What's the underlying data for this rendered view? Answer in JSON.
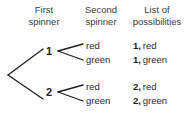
{
  "figure": {
    "type": "probability-tree-diagram",
    "background": "#ffffff",
    "line_color": "#1e1e1e",
    "text_color": "#2b2b2b"
  },
  "headers": {
    "first_spinner": {
      "line1": "First",
      "line2": "spinner"
    },
    "second_spinner": {
      "line1": "Second",
      "line2": "spinner"
    },
    "list_of_possibilities": {
      "line1": "List of",
      "line2": "possibilities"
    }
  },
  "tree": {
    "root": {
      "x": 8,
      "y": 75
    },
    "level1": [
      {
        "label": "1",
        "x": 50,
        "y": 51
      },
      {
        "label": "2",
        "x": 50,
        "y": 92
      }
    ],
    "level2": [
      {
        "parent": "1",
        "label": "red",
        "x": 90,
        "y": 45
      },
      {
        "parent": "1",
        "label": "green",
        "x": 90,
        "y": 59
      },
      {
        "parent": "2",
        "label": "red",
        "x": 90,
        "y": 86
      },
      {
        "parent": "2",
        "label": "green",
        "x": 90,
        "y": 100
      }
    ]
  },
  "outcomes": [
    {
      "number": "1,",
      "color": "red",
      "text": "1, red"
    },
    {
      "number": "1,",
      "color": "green",
      "text": "1, green"
    },
    {
      "number": "2,",
      "color": "red",
      "text": "2, red"
    },
    {
      "number": "2,",
      "color": "green",
      "text": "2, green"
    }
  ]
}
